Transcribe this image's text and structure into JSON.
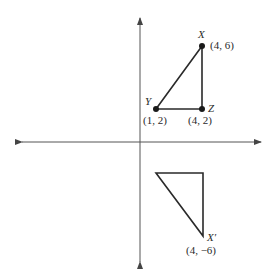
{
  "diagram": {
    "type": "coordinate-plane-reflection",
    "axes": {
      "origin_px": [
        140,
        142
      ],
      "x_axis": {
        "from_px": 18,
        "to_px": 265,
        "arrows": "both"
      },
      "y_axis": {
        "from_px": 14,
        "to_px": 266,
        "arrows": "both"
      }
    },
    "original_triangle": {
      "vertices": [
        {
          "name": "X",
          "coords": "(4, 6)",
          "px": [
            202,
            46
          ]
        },
        {
          "name": "Y",
          "coords": "(1, 2)",
          "px": [
            156,
            109
          ]
        },
        {
          "name": "Z",
          "coords": "(4, 2)",
          "px": [
            202,
            109
          ]
        }
      ]
    },
    "image_triangle": {
      "vertices": [
        {
          "name": "",
          "px": [
            156,
            173
          ]
        },
        {
          "name": "",
          "px": [
            203,
            173
          ]
        },
        {
          "name": "X′",
          "coords": "(4, −6)",
          "px": [
            203,
            236
          ]
        }
      ]
    }
  },
  "labels": {
    "x_name": "X",
    "x_coords": "(4, 6)",
    "y_name": "Y",
    "y_coords": "(1, 2)",
    "z_name": "Z",
    "z_coords": "(4, 2)",
    "xprime_name": "X′",
    "xprime_coords": "(4, −6)"
  },
  "colors": {
    "stroke": "#2a2a2a",
    "axis": "#555555",
    "background": "#ffffff"
  }
}
